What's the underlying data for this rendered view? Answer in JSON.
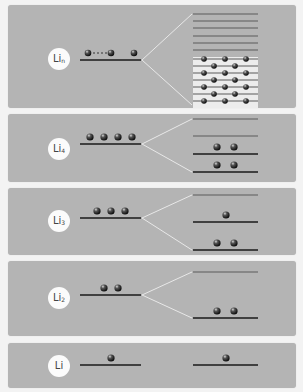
{
  "figure": {
    "colors": {
      "background": "#f3f3f3",
      "panel": "#b4b4b4",
      "label_bg": "#fbfbfb",
      "level_line": "#1a1a1a",
      "split_level": "#555555",
      "band_bg": "#ececec",
      "connector": "#e8e8e8",
      "electron": "#222222"
    },
    "panels": [
      {
        "id": "li-n",
        "label": "Li",
        "subscript": "n",
        "left_electrons": "n (shown as 2 … 2 with dots)",
        "right_levels_empty": 6,
        "right_band_lines": 7,
        "description": "band formation: many levels"
      },
      {
        "id": "li-4",
        "label": "Li",
        "subscript": "4",
        "left_electrons": 4,
        "right_levels": [
          0,
          0,
          2,
          2
        ]
      },
      {
        "id": "li-3",
        "label": "Li",
        "subscript": "3",
        "left_electrons": 3,
        "right_levels": [
          0,
          1,
          2
        ]
      },
      {
        "id": "li-2",
        "label": "Li",
        "subscript": "2",
        "left_electrons": 2,
        "right_levels": [
          0,
          2
        ]
      },
      {
        "id": "li-1",
        "label": "Li",
        "subscript": "",
        "left_electrons": 1,
        "right_levels": [
          1
        ]
      }
    ]
  }
}
